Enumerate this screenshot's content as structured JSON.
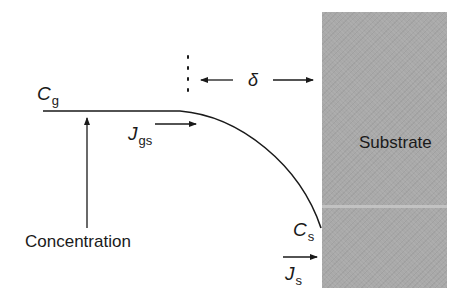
{
  "diagram": {
    "type": "boundary-layer concentration profile",
    "substrate_label": "Substrate",
    "gas_concentration": {
      "symbol": "C",
      "subscript": "g"
    },
    "surface_concentration": {
      "symbol": "C",
      "subscript": "s"
    },
    "gas_to_surface_flux": {
      "symbol": "J",
      "subscript": "gs"
    },
    "surface_flux": {
      "symbol": "J",
      "subscript": "s"
    },
    "boundary_layer_thickness": "δ",
    "axis_label": "Concentration",
    "colors": {
      "line": "#1a1a1a",
      "substrate": "#a9a9a9",
      "background": "#ffffff"
    }
  }
}
